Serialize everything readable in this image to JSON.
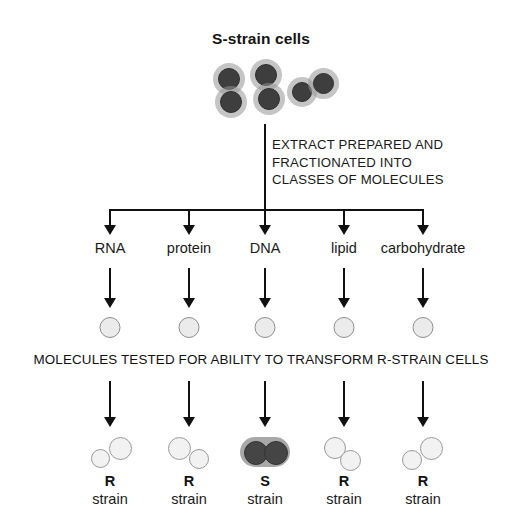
{
  "figure": {
    "title": "S-strain cells",
    "extract_text": "EXTRACT PREPARED AND\nFRACTIONATED INTO\nCLASSES OF MOLECULES",
    "banner_text": "MOLECULES TESTED FOR ABILITY TO TRANSFORM R-STRAIN CELLS"
  },
  "columns": [
    {
      "class_label": "RNA",
      "result_letter": "R",
      "result_word": "strain",
      "result_type": "r-strain",
      "x": 110
    },
    {
      "class_label": "protein",
      "result_letter": "R",
      "result_word": "strain",
      "result_type": "r-strain",
      "x": 189
    },
    {
      "class_label": "DNA",
      "result_letter": "S",
      "result_word": "strain",
      "result_type": "s-strain",
      "x": 265
    },
    {
      "class_label": "lipid",
      "result_letter": "R",
      "result_word": "strain",
      "result_type": "r-strain",
      "x": 344
    },
    {
      "class_label": "carbohydrate",
      "result_letter": "R",
      "result_word": "strain",
      "result_type": "r-strain",
      "x": 423
    }
  ],
  "colors": {
    "line": "#111111",
    "dark_cell": "#3e3e3e",
    "capsule_halo": "#a8a8a8",
    "open_cell_fill": "#f2f2f2",
    "open_cell_border": "#9a9a9a",
    "background": "#ffffff"
  }
}
